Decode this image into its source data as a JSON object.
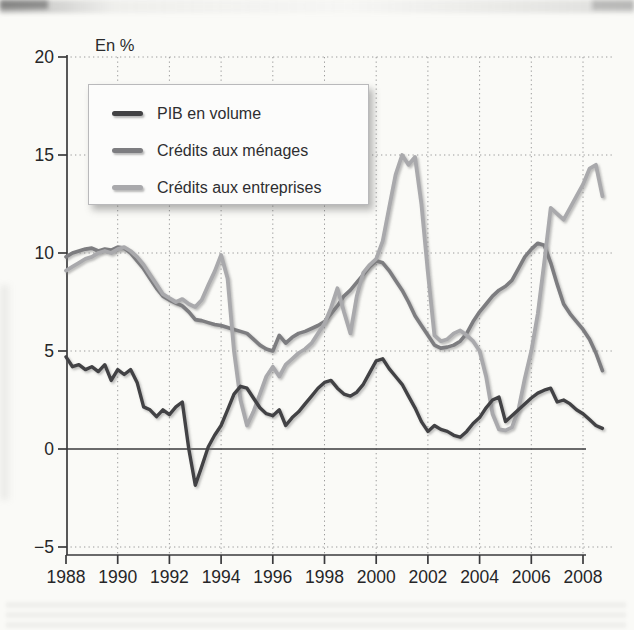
{
  "header": {
    "unit_label": "En %"
  },
  "legend": {
    "items": [
      {
        "label": "PIB en volume",
        "color": "#424244"
      },
      {
        "label": "Crédits aux ménages",
        "color": "#7d7d80"
      },
      {
        "label": "Crédits aux entreprises",
        "color": "#a9a9ac"
      }
    ]
  },
  "chart_data": {
    "type": "line",
    "title": "",
    "ylabel": "En %",
    "xlabel": "",
    "ylim": [
      -5,
      20
    ],
    "y_ticks": [
      -5,
      0,
      5,
      10,
      15,
      20
    ],
    "x_tick_years": [
      1988,
      1990,
      1992,
      1994,
      1996,
      1998,
      2000,
      2002,
      2004,
      2006,
      2008
    ],
    "x_start": 1988.0,
    "x_step": 0.25,
    "grid": "dotted horizontal at -5,5,10,15,20 and dotted vertical at even years; solid zero line",
    "legend_position": "top-left box",
    "series": [
      {
        "name": "PIB en volume",
        "color": "#424244",
        "values": [
          4.7,
          4.2,
          4.3,
          4.05,
          4.2,
          3.95,
          4.3,
          3.5,
          4.05,
          3.8,
          4.05,
          3.4,
          2.15,
          2.0,
          1.65,
          2.0,
          1.75,
          2.15,
          2.4,
          0.0,
          -1.85,
          -0.9,
          0.1,
          0.7,
          1.2,
          2.0,
          2.8,
          3.2,
          3.1,
          2.6,
          2.1,
          1.8,
          1.7,
          2.0,
          1.2,
          1.6,
          1.9,
          2.3,
          2.7,
          3.1,
          3.4,
          3.5,
          3.1,
          2.8,
          2.7,
          2.9,
          3.3,
          3.9,
          4.5,
          4.6,
          4.1,
          3.7,
          3.3,
          2.7,
          2.1,
          1.4,
          0.9,
          1.2,
          1.0,
          0.9,
          0.7,
          0.6,
          0.9,
          1.3,
          1.6,
          2.1,
          2.5,
          2.65,
          1.4,
          1.7,
          2.0,
          2.3,
          2.6,
          2.85,
          3.0,
          3.1,
          2.4,
          2.5,
          2.3,
          2.0,
          1.8,
          1.5,
          1.2,
          1.05
        ]
      },
      {
        "name": "Crédits aux ménages",
        "color": "#7d7d80",
        "values": [
          9.8,
          10.0,
          10.1,
          10.2,
          10.25,
          10.1,
          10.2,
          10.15,
          10.3,
          10.25,
          10.0,
          9.6,
          9.2,
          8.7,
          8.2,
          7.8,
          7.6,
          7.45,
          7.3,
          7.0,
          6.6,
          6.55,
          6.45,
          6.35,
          6.3,
          6.2,
          6.1,
          6.0,
          5.9,
          5.6,
          5.3,
          5.1,
          5.0,
          5.8,
          5.4,
          5.7,
          5.9,
          6.0,
          6.15,
          6.3,
          6.5,
          6.9,
          7.3,
          7.8,
          8.1,
          8.5,
          8.9,
          9.3,
          9.6,
          9.5,
          9.1,
          8.6,
          8.1,
          7.5,
          6.8,
          6.3,
          5.8,
          5.3,
          5.15,
          5.2,
          5.3,
          5.5,
          5.9,
          6.5,
          7.0,
          7.4,
          7.8,
          8.1,
          8.3,
          8.6,
          9.2,
          9.8,
          10.2,
          10.5,
          10.4,
          9.5,
          8.4,
          7.4,
          6.9,
          6.5,
          6.1,
          5.6,
          4.9,
          4.0
        ]
      },
      {
        "name": "Crédits aux entreprises",
        "color": "#a9a9ac",
        "values": [
          9.1,
          9.3,
          9.5,
          9.7,
          9.8,
          10.0,
          10.1,
          10.0,
          10.2,
          10.3,
          10.1,
          9.8,
          9.4,
          8.9,
          8.4,
          7.9,
          7.7,
          7.5,
          7.65,
          7.4,
          7.25,
          7.6,
          8.35,
          9.05,
          9.9,
          8.7,
          5.0,
          2.5,
          1.2,
          1.9,
          2.8,
          3.7,
          4.2,
          3.7,
          4.3,
          4.6,
          4.9,
          5.1,
          5.4,
          5.9,
          6.4,
          7.2,
          8.2,
          7.0,
          5.9,
          7.8,
          9.0,
          9.4,
          9.7,
          10.6,
          12.3,
          14.0,
          15.0,
          14.5,
          14.9,
          12.5,
          9.0,
          5.8,
          5.5,
          5.6,
          5.9,
          6.05,
          5.8,
          5.5,
          5.0,
          3.7,
          1.8,
          1.0,
          0.95,
          1.1,
          2.0,
          3.6,
          5.0,
          6.9,
          9.5,
          12.3,
          12.0,
          11.7,
          12.3,
          12.9,
          13.5,
          14.3,
          14.5,
          12.9
        ]
      }
    ]
  }
}
